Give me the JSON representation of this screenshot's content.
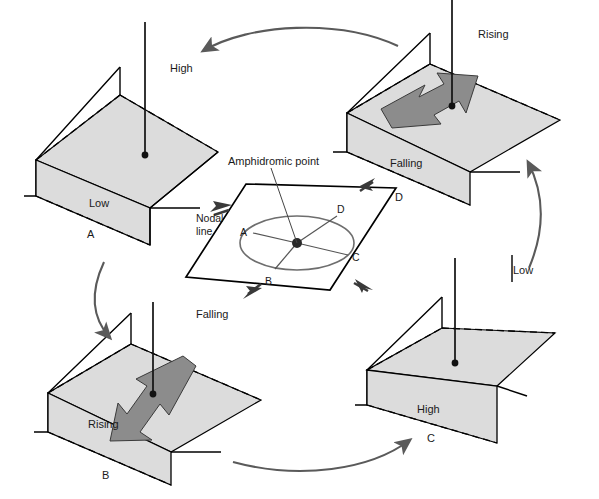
{
  "figure": {
    "type": "diagram",
    "colors": {
      "surface_fill": "#dcdcdc",
      "flow_arrow_fill": "#8c8c8c",
      "outline": "#000000",
      "cycle_arrow": "#5a5a5a",
      "ellipse": "#6e6e6e"
    }
  },
  "center": {
    "amphidromic_label": "Amphidromic point",
    "nodal_line_label": "Nodal\nline",
    "nodal_line_label_1": "Nodal",
    "nodal_line_label_2": "line",
    "ellipse_points": [
      {
        "id": "A",
        "label": "A",
        "position": "left"
      },
      {
        "id": "B",
        "label": "B",
        "position": "bottom-left"
      },
      {
        "id": "C",
        "label": "C",
        "position": "right"
      },
      {
        "id": "D",
        "label": "D",
        "position": "upper-right"
      }
    ],
    "pointer_arrows": [
      {
        "toward": "A",
        "direction": "up-left"
      },
      {
        "toward": "D",
        "direction": "up-right"
      },
      {
        "toward": "B",
        "direction": "down-left"
      },
      {
        "toward": "C",
        "direction": "down-right"
      }
    ]
  },
  "panels": [
    {
      "id": "A",
      "letter": "A",
      "position": "top-left",
      "state": "static-tilt",
      "labels": {
        "near": "Low",
        "far": "High"
      },
      "has_flow_arrow": false
    },
    {
      "id": "D",
      "letter": "D",
      "position": "top-right",
      "state": "transition",
      "labels": {
        "near": "Falling",
        "far": "Rising"
      },
      "has_flow_arrow": true,
      "flow_direction": "up-right"
    },
    {
      "id": "B",
      "letter": "B",
      "position": "bottom-left",
      "state": "transition",
      "labels": {
        "near": "Rising",
        "far": "Falling"
      },
      "has_flow_arrow": true,
      "flow_direction": "down-left"
    },
    {
      "id": "C",
      "letter": "C",
      "position": "bottom-right",
      "state": "static-tilt",
      "labels": {
        "near": "High",
        "far": "Low"
      },
      "has_flow_arrow": false
    }
  ],
  "cycle_arrows": [
    {
      "from": "D",
      "to": "A",
      "location": "top"
    },
    {
      "from": "A",
      "to": "B",
      "location": "left"
    },
    {
      "from": "B",
      "to": "C",
      "location": "bottom"
    },
    {
      "from": "C",
      "to": "D",
      "location": "right"
    }
  ]
}
